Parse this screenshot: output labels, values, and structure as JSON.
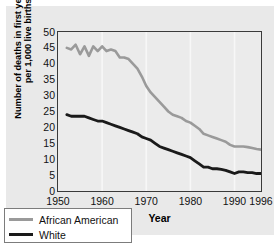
{
  "chart_data": {
    "type": "line",
    "title": "",
    "xlabel": "Year",
    "ylabel": "Number of deaths in first year of life per 1,000 live births",
    "xlim": [
      1950,
      1996
    ],
    "ylim": [
      0,
      50
    ],
    "xticks": [
      1950,
      1960,
      1970,
      1980,
      1990,
      1996
    ],
    "yticks": [
      0,
      5,
      10,
      15,
      20,
      25,
      30,
      35,
      40,
      45,
      50
    ],
    "grid": "vertical-only",
    "legend_position": "lower-left-inside",
    "series": [
      {
        "name": "African American",
        "color": "#9a9a9a",
        "x": [
          1952,
          1953,
          1954,
          1955,
          1956,
          1957,
          1958,
          1959,
          1960,
          1961,
          1962,
          1963,
          1964,
          1965,
          1966,
          1967,
          1968,
          1969,
          1970,
          1971,
          1972,
          1973,
          1974,
          1975,
          1976,
          1977,
          1978,
          1979,
          1980,
          1981,
          1982,
          1983,
          1984,
          1985,
          1986,
          1987,
          1988,
          1989,
          1990,
          1991,
          1992,
          1993,
          1994,
          1995,
          1996
        ],
        "values": [
          45.0,
          44.5,
          46.0,
          43.0,
          45.5,
          42.5,
          45.5,
          44.0,
          45.5,
          44.0,
          44.5,
          44.0,
          42.0,
          42.0,
          41.5,
          40.0,
          38.5,
          36.0,
          33.0,
          31.0,
          29.5,
          28.0,
          26.5,
          25.0,
          24.0,
          23.5,
          23.0,
          22.0,
          21.5,
          20.5,
          19.5,
          18.0,
          17.5,
          17.0,
          16.5,
          16.0,
          15.5,
          14.5,
          14.0,
          14.0,
          14.0,
          13.8,
          13.5,
          13.2,
          13.0
        ]
      },
      {
        "name": "White",
        "color": "#1a1a1a",
        "x": [
          1952,
          1953,
          1954,
          1955,
          1956,
          1957,
          1958,
          1959,
          1960,
          1961,
          1962,
          1963,
          1964,
          1965,
          1966,
          1967,
          1968,
          1969,
          1970,
          1971,
          1972,
          1973,
          1974,
          1975,
          1976,
          1977,
          1978,
          1979,
          1980,
          1981,
          1982,
          1983,
          1984,
          1985,
          1986,
          1987,
          1988,
          1989,
          1990,
          1991,
          1992,
          1993,
          1994,
          1995,
          1996
        ],
        "values": [
          24.0,
          23.5,
          23.5,
          23.5,
          23.5,
          23.0,
          22.5,
          22.0,
          22.0,
          21.5,
          21.0,
          20.5,
          20.0,
          19.5,
          19.0,
          18.5,
          18.0,
          17.0,
          16.5,
          16.0,
          15.0,
          14.0,
          13.5,
          13.0,
          12.5,
          12.0,
          11.5,
          11.0,
          10.5,
          9.5,
          8.5,
          7.5,
          7.5,
          7.0,
          7.0,
          6.8,
          6.5,
          6.0,
          5.5,
          6.0,
          6.0,
          5.8,
          5.8,
          5.5,
          5.5
        ]
      }
    ]
  },
  "axes": {
    "y_title": "Number of deaths in first year of life per 1,000 live births",
    "x_title": "Year",
    "y_tick_labels": [
      "50",
      "45",
      "40",
      "35",
      "30",
      "25",
      "20",
      "15",
      "10",
      "5",
      "0"
    ],
    "x_tick_labels": [
      "1950",
      "1960",
      "1970",
      "1980",
      "1990",
      "1996"
    ]
  },
  "legend": {
    "items": [
      {
        "label": "African American",
        "color": "#9a9a9a"
      },
      {
        "label": "White",
        "color": "#1a1a1a"
      }
    ]
  }
}
